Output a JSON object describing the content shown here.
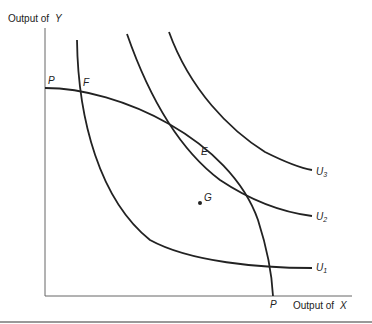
{
  "axes": {
    "y_label_prefix": "Output of",
    "y_label_var": "Y",
    "x_label_prefix": "Output of",
    "x_label_var": "X"
  },
  "points": {
    "P_top": "P",
    "F": "F",
    "E": "E",
    "G": "G",
    "P_bottom": "P"
  },
  "curves": {
    "U1": "U",
    "U1_sub": "1",
    "U2": "U",
    "U2_sub": "2",
    "U3": "U",
    "U3_sub": "3"
  },
  "colors": {
    "line": "#222222",
    "axis": "#555555"
  }
}
